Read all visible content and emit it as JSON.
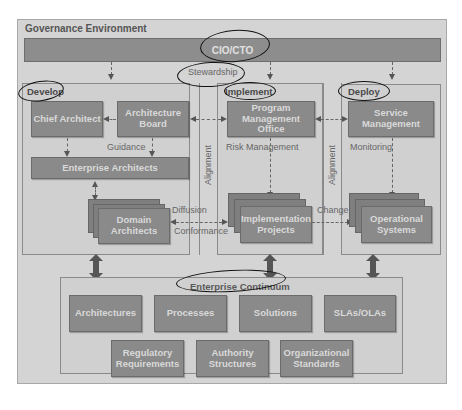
{
  "governance": {
    "title": "Governance Environment",
    "top_bar": "CIO/CTO",
    "stewardship": "Stewardship"
  },
  "develop": {
    "label": "Develop",
    "chief_architect": "Chief Architect",
    "architecture_board": "Architecture Board",
    "guidance": "Guidance",
    "enterprise_architects": "Enterprise Architects",
    "domain_architects": "Domain Architects",
    "diffusion": "Diffusion",
    "conformance": "Conformance"
  },
  "implement": {
    "label": "Implement",
    "pmo": "Program Management Office",
    "risk_management": "Risk Management",
    "implementation_projects": "Implementation Projects",
    "change": "Change"
  },
  "deploy": {
    "label": "Deploy",
    "service_management": "Service Management",
    "monitoring": "Monitoring",
    "operational_systems": "Operational Systems"
  },
  "alignment": {
    "left": "Alignment",
    "right": "Alignment"
  },
  "continuum": {
    "title": "Enterprise Continuum",
    "row1": [
      "Architectures",
      "Processes",
      "Solutions",
      "SLAs/OLAs"
    ],
    "row2": [
      "Regulatory Requirements",
      "Authority Structures",
      "Organizational Standards"
    ]
  },
  "colors": {
    "box_fill": "#8a8a8a",
    "panel_fill": "#d0d0d0",
    "background": "#d4d4d4",
    "ink_annotation": "#111111"
  }
}
